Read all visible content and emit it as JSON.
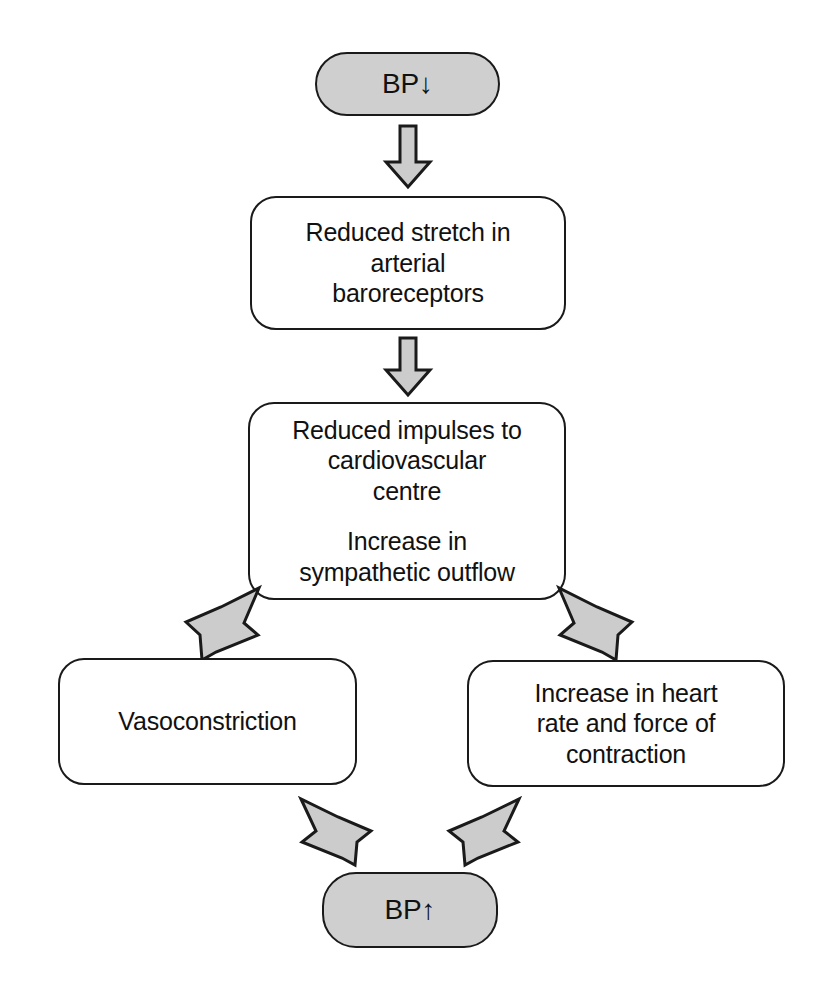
{
  "diagram": {
    "type": "flowchart",
    "colors": {
      "terminator_fill": "#cfcfcf",
      "process_fill": "#ffffff",
      "outline": "#1a1a1a",
      "arrow_fill": "#cccccc",
      "background": "#ffffff"
    },
    "nodes": [
      {
        "id": "bp-down",
        "shape": "terminator",
        "fill": "#cfcfcf",
        "lines": [
          "BP↓"
        ]
      },
      {
        "id": "reduced-stretch",
        "shape": "process",
        "fill": "#ffffff",
        "lines": [
          "Reduced stretch in",
          "arterial",
          "baroreceptors"
        ]
      },
      {
        "id": "reduced-impulses",
        "shape": "process",
        "fill": "#ffffff",
        "paragraphs": [
          [
            "Reduced impulses to",
            "cardiovascular",
            "centre"
          ],
          [
            "Increase in",
            "sympathetic outflow"
          ]
        ]
      },
      {
        "id": "vasoconstriction",
        "shape": "process",
        "fill": "#ffffff",
        "lines": [
          "Vasoconstriction"
        ]
      },
      {
        "id": "increase-heart-rate",
        "shape": "process",
        "fill": "#ffffff",
        "lines": [
          "Increase in heart",
          "rate and force of",
          "contraction"
        ]
      },
      {
        "id": "bp-up",
        "shape": "terminator",
        "fill": "#cfcfcf",
        "lines": [
          "BP↑"
        ]
      }
    ],
    "edges": [
      {
        "id": "e1",
        "from": "bp-down",
        "to": "reduced-stretch",
        "direction": "down"
      },
      {
        "id": "e2",
        "from": "reduced-stretch",
        "to": "reduced-impulses",
        "direction": "down"
      },
      {
        "id": "e3",
        "from": "reduced-impulses",
        "to": "vasoconstriction",
        "direction": "down-left"
      },
      {
        "id": "e4",
        "from": "reduced-impulses",
        "to": "increase-heart-rate",
        "direction": "down-right"
      },
      {
        "id": "e5",
        "from": "vasoconstriction",
        "to": "bp-up",
        "direction": "down-right"
      },
      {
        "id": "e6",
        "from": "increase-heart-rate",
        "to": "bp-up",
        "direction": "down-left"
      }
    ]
  },
  "labels": {
    "bp_down": "BP↓",
    "bp_up": "BP↑",
    "reduced_stretch_l1": "Reduced stretch in",
    "reduced_stretch_l2": "arterial",
    "reduced_stretch_l3": "baroreceptors",
    "reduced_impulses_l1": "Reduced impulses to",
    "reduced_impulses_l2": "cardiovascular",
    "reduced_impulses_l3": "centre",
    "increase_sympathetic_l1": "Increase in",
    "increase_sympathetic_l2": "sympathetic outflow",
    "vasoconstriction": "Vasoconstriction",
    "increase_hr_l1": "Increase in heart",
    "increase_hr_l2": "rate and force of",
    "increase_hr_l3": "contraction"
  }
}
